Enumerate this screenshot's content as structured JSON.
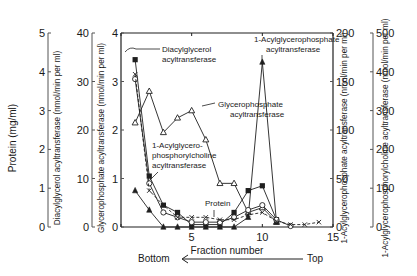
{
  "chart_data": {
    "type": "line",
    "title": "",
    "xlabel": "Fraction number",
    "x_ticks": [
      5,
      10,
      15
    ],
    "xlim": [
      0,
      15
    ],
    "direction_label": {
      "left": "Bottom",
      "right": "Top"
    },
    "axes": [
      {
        "id": "protein",
        "side": "left",
        "label": "Protein (mg/ml)",
        "range": [
          0,
          5
        ],
        "ticks": [
          0,
          1,
          2,
          3,
          4,
          5
        ]
      },
      {
        "id": "dag",
        "side": "left",
        "label": "Diacylglycerol acyltransferase (nmol/min per ml)",
        "range": [
          0,
          40
        ],
        "ticks": [
          0,
          10,
          20,
          30,
          40
        ]
      },
      {
        "id": "gp",
        "side": "left",
        "label": "Glycerophosphate acyltransferase (nmol/min per ml)",
        "range": [
          0,
          4
        ],
        "ticks": [
          0,
          1,
          2,
          3,
          4
        ]
      },
      {
        "id": "lpa",
        "side": "right",
        "label": "1-Acylglycerophosphate acyltransferase (nmol/min per ml)",
        "range": [
          0,
          200
        ],
        "ticks": [
          0,
          50,
          100,
          150,
          200
        ]
      },
      {
        "id": "lpc",
        "side": "right",
        "label": "1-Acylglycerophosphorylcholine acyltransferase (nmol/min per ml)",
        "range": [
          0,
          500
        ],
        "ticks": [
          0,
          100,
          200,
          300,
          400,
          500
        ]
      }
    ],
    "series": [
      {
        "name": "Glycerophosphate acyltransferase",
        "marker": "open-triangle",
        "dash": false,
        "x": [
          1,
          2,
          3,
          4,
          5,
          6,
          7,
          8,
          9,
          10,
          11
        ],
        "values_plot_units": [
          2.15,
          2.8,
          1.95,
          2.25,
          2.4,
          1.8,
          0.9,
          0.9,
          0.3,
          0.4,
          0.1
        ]
      },
      {
        "name": "1-Acylglycerophosphate acyltransferase",
        "marker": "filled-triangle",
        "dash": false,
        "x": [
          1,
          2,
          3,
          4,
          5,
          6,
          7,
          8,
          9,
          10,
          11
        ],
        "values_plot_units": [
          0.75,
          0.35,
          0,
          0,
          0,
          0,
          0,
          0,
          0.2,
          3.4,
          0.1
        ]
      },
      {
        "name": "Diacylglycerol acyltransferase",
        "marker": "filled-square",
        "dash": false,
        "x": [
          1,
          2,
          3,
          4,
          5,
          6,
          7,
          8,
          9,
          10,
          11
        ],
        "values_plot_units": [
          3.45,
          1.05,
          0.45,
          0.3,
          0.05,
          0.05,
          0.05,
          0.3,
          0.75,
          0.85,
          0.15
        ]
      },
      {
        "name": "1-Acylglycerophosphorylcholine acyltransferase",
        "marker": "open-circle",
        "dash": false,
        "x": [
          1,
          2,
          3,
          4,
          5,
          6,
          7,
          8,
          9,
          10,
          11,
          12
        ],
        "values_plot_units": [
          3.05,
          0.9,
          0.3,
          0.2,
          0.1,
          0.1,
          0.1,
          0.2,
          0.35,
          0.45,
          0.15,
          0.02
        ]
      },
      {
        "name": "Protein",
        "marker": "cross",
        "dash": true,
        "x": [
          1,
          2,
          3,
          4,
          5,
          6,
          7,
          8,
          9,
          10,
          11,
          12,
          13,
          14
        ],
        "values_plot_units": [
          3.15,
          0.75,
          0.45,
          0.2,
          0.2,
          0.2,
          0.15,
          0.15,
          0.25,
          0.3,
          0.12,
          0.05,
          0.05,
          0.1
        ]
      }
    ],
    "annotations": [
      {
        "text": [
          "Diacylglycerol",
          "acyltransferase"
        ],
        "x": 162,
        "y": 52
      },
      {
        "text": [
          "Glycerophosphate",
          "acyltransferase"
        ],
        "x": 218,
        "y": 107
      },
      {
        "text": [
          "1-Acylglycero-",
          "phosphorylcholine",
          "acyltransferase"
        ],
        "x": 152,
        "y": 148
      },
      {
        "text": [
          "Protein"
        ],
        "x": 205,
        "y": 206
      },
      {
        "text": [
          "1-Acylglycerophosphate",
          "acyltransferase"
        ],
        "x": 254,
        "y": 42
      }
    ],
    "grid": false,
    "legend": "inline annotations"
  }
}
